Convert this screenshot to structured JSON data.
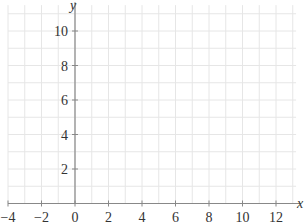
{
  "chart_data": {
    "type": "scatter",
    "title": "",
    "xlabel": "x",
    "ylabel": "y",
    "xlim": [
      -4,
      13.2
    ],
    "ylim": [
      0,
      11.5
    ],
    "x_ticks": [
      -4,
      -2,
      0,
      2,
      4,
      6,
      8,
      10,
      12
    ],
    "y_ticks": [
      2,
      4,
      6,
      8,
      10
    ],
    "x_tick_labels": [
      "−4",
      "−2",
      "0",
      "2",
      "4",
      "6",
      "8",
      "10",
      "12"
    ],
    "y_tick_labels": [
      "2",
      "4",
      "6",
      "8",
      "10"
    ],
    "grid": true,
    "grid_step": 1,
    "series": []
  },
  "style": {
    "axis_color": "#888888",
    "grid_color": "#e6e6e6",
    "text_color": "#333333"
  }
}
